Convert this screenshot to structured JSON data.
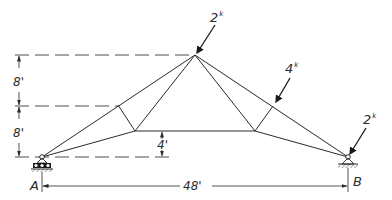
{
  "diagram": {
    "type": "truss",
    "nodes": {
      "A": {
        "label": "A",
        "support": "roller"
      },
      "B": {
        "label": "B",
        "support": "pin"
      }
    },
    "loads": [
      {
        "id": "apex_load",
        "value": "2",
        "unit": "k"
      },
      {
        "id": "right_panel_load",
        "value": "4",
        "unit": "k"
      },
      {
        "id": "support_b_load",
        "value": "2",
        "unit": "k"
      }
    ],
    "dimensions": {
      "upper_height": "8'",
      "lower_height": "8'",
      "bottom_chord_rise": "4'",
      "span": "48'"
    },
    "colors": {
      "line": "#2a2a2a",
      "background": "#ffffff"
    }
  }
}
